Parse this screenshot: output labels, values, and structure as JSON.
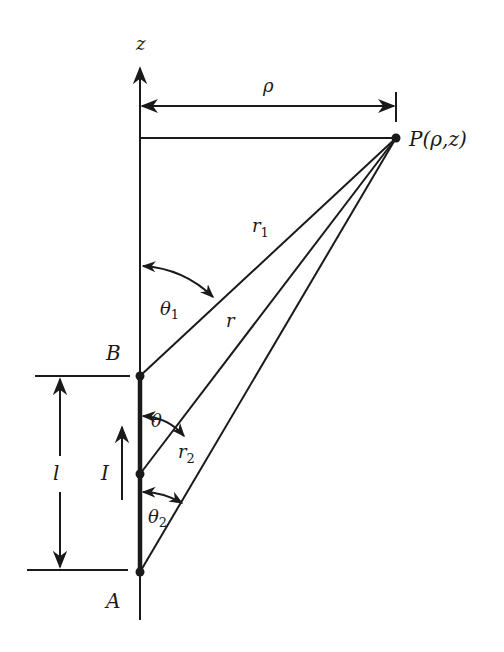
{
  "diagram": {
    "axis_label": "z",
    "point_label": "P(ρ,z)",
    "rho_label": "ρ",
    "labels": {
      "r1": "r",
      "r1_sub": "1",
      "r": "r",
      "r2": "r",
      "r2_sub": "2",
      "theta1": "θ",
      "theta1_sub": "1",
      "theta": "θ",
      "theta2": "θ",
      "theta2_sub": "2",
      "B": "B",
      "A": "A",
      "I": "I",
      "l": "l"
    },
    "colors": {
      "ink": "#1a1a1a",
      "background": "#ffffff"
    }
  }
}
